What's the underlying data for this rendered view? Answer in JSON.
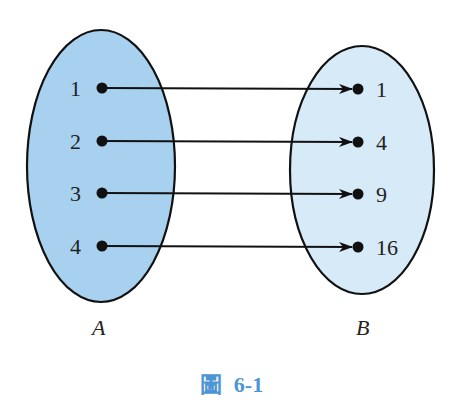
{
  "diagram": {
    "type": "set-mapping",
    "colors": {
      "set_a_fill": "#a8d1ef",
      "set_b_fill": "#d6eaf8",
      "stroke": "#111111",
      "caption": "#4e95d4"
    },
    "set_a": {
      "name": "A",
      "elements": [
        "1",
        "2",
        "3",
        "4"
      ]
    },
    "set_b": {
      "name": "B",
      "elements": [
        "1",
        "4",
        "9",
        "16"
      ]
    },
    "mappings": [
      {
        "from": "1",
        "to": "1"
      },
      {
        "from": "2",
        "to": "4"
      },
      {
        "from": "3",
        "to": "9"
      },
      {
        "from": "4",
        "to": "16"
      }
    ],
    "caption": {
      "prefix": "圖",
      "number": "6-1"
    }
  }
}
